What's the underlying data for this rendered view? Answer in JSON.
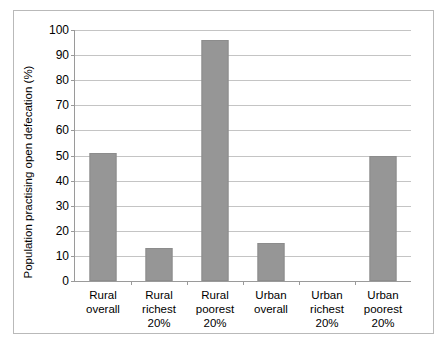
{
  "chart_data": {
    "type": "bar",
    "title": "",
    "xlabel": "",
    "ylabel": "Population practising open defecation (%)",
    "categories": [
      "Rural overall",
      "Rural richest 20%",
      "Rural poorest 20%",
      "Urban overall",
      "Urban richest 20%",
      "Urban poorest 20%"
    ],
    "category_lines": [
      [
        "Rural",
        "overall"
      ],
      [
        "Rural",
        "richest",
        "20%"
      ],
      [
        "Rural",
        "poorest",
        "20%"
      ],
      [
        "Urban",
        "overall"
      ],
      [
        "Urban",
        "richest",
        "20%"
      ],
      [
        "Urban",
        "poorest",
        "20%"
      ]
    ],
    "values": [
      51,
      13,
      96,
      15,
      0,
      50
    ],
    "ylim": [
      0,
      100
    ],
    "ytick_step": 10,
    "yticks": [
      0,
      10,
      20,
      30,
      40,
      50,
      60,
      70,
      80,
      90,
      100
    ],
    "grid": true,
    "legend": false,
    "bar_color": "#969696",
    "grid_color": "#c4c4c4",
    "axis_color": "#9a9a9a"
  },
  "figure": {
    "top_sliver_text": ""
  }
}
